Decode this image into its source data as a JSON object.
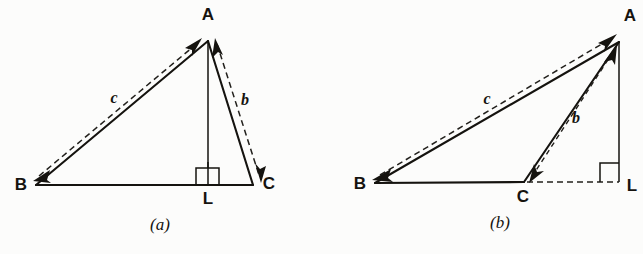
{
  "figure": {
    "background_color": "#fcfcfb",
    "ink_color": "#15130f",
    "panels": [
      {
        "id": "a",
        "caption": "(a)",
        "caption_pos": {
          "x": 160,
          "y": 229
        },
        "description": "Acute triangle ABC with altitude AL dropped from A onto BC, foot L between B and C",
        "vertices": [
          {
            "name": "A",
            "label": "A",
            "x": 208,
            "y": 41,
            "label_x": 208,
            "label_y": 20
          },
          {
            "name": "B",
            "label": "B",
            "x": 36,
            "y": 185,
            "label_x": 21,
            "label_y": 190
          },
          {
            "name": "C",
            "label": "C",
            "x": 253,
            "y": 185,
            "label_x": 269,
            "label_y": 189
          },
          {
            "name": "L",
            "label": "L",
            "x": 208,
            "y": 185,
            "label_x": 208,
            "label_y": 203
          }
        ],
        "sides": [
          {
            "name": "c",
            "label": "c",
            "from": "B",
            "to": "A",
            "label_x": 114,
            "label_y": 101
          },
          {
            "name": "b",
            "label": "b",
            "from": "A",
            "to": "C",
            "label_x": 245,
            "label_y": 103
          }
        ],
        "right_angle": {
          "at": "L",
          "size": 23,
          "marker": "square"
        },
        "vectors": [
          {
            "name": "c-vector",
            "label": "c",
            "double_headed": true,
            "style": "dashed"
          },
          {
            "name": "b-vector",
            "label": "b",
            "double_headed": true,
            "style": "dashed"
          }
        ]
      },
      {
        "id": "b",
        "caption": "(b)",
        "caption_pos": {
          "x": 500,
          "y": 227
        },
        "description": "Obtuse triangle ABC with altitude AL dropped from A onto extension of BC beyond C, foot L outside segment BC",
        "vertices": [
          {
            "name": "A",
            "label": "A",
            "x": 619,
            "y": 42,
            "label_x": 630,
            "label_y": 21
          },
          {
            "name": "B",
            "label": "B",
            "x": 375,
            "y": 183,
            "label_x": 360,
            "label_y": 188
          },
          {
            "name": "C",
            "label": "C",
            "x": 524,
            "y": 182,
            "label_x": 523,
            "label_y": 201
          },
          {
            "name": "L",
            "label": "L",
            "x": 619,
            "y": 182,
            "label_x": 631,
            "label_y": 190
          }
        ],
        "sides": [
          {
            "name": "c",
            "label": "c",
            "from": "B",
            "to": "A",
            "label_x": 487,
            "label_y": 102
          },
          {
            "name": "b",
            "label": "b",
            "from": "A",
            "to": "C",
            "label_x": 576,
            "label_y": 121
          }
        ],
        "right_angle": {
          "at": "L",
          "size": 19,
          "marker": "square"
        },
        "extension": {
          "name": "cl-extension",
          "from": "C",
          "to": "L",
          "style": "dashed"
        },
        "vectors": [
          {
            "name": "c-vector",
            "label": "c",
            "double_headed": true,
            "style": "dashed"
          },
          {
            "name": "b-vector",
            "label": "b",
            "double_headed": true,
            "style": "dashed"
          }
        ]
      }
    ]
  }
}
